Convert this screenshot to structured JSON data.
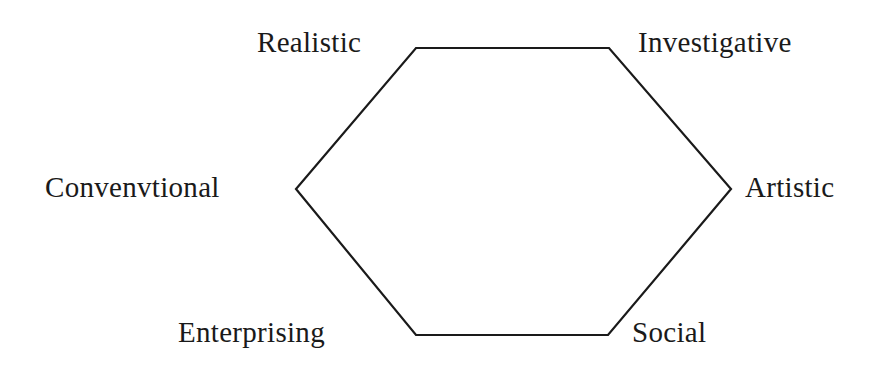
{
  "diagram": {
    "type": "hexagon",
    "stroke_color": "#1a1a1a",
    "vertices": [
      {
        "x": 416,
        "y": 48
      },
      {
        "x": 609,
        "y": 48
      },
      {
        "x": 731,
        "y": 189
      },
      {
        "x": 608,
        "y": 335
      },
      {
        "x": 416,
        "y": 335
      },
      {
        "x": 296,
        "y": 189
      }
    ],
    "labels": {
      "realistic": "Realistic",
      "investigative": "Investigative",
      "artistic": "Artistic",
      "social": "Social",
      "enterprising": "Enterprising",
      "conventional": "Convenvtional"
    }
  }
}
